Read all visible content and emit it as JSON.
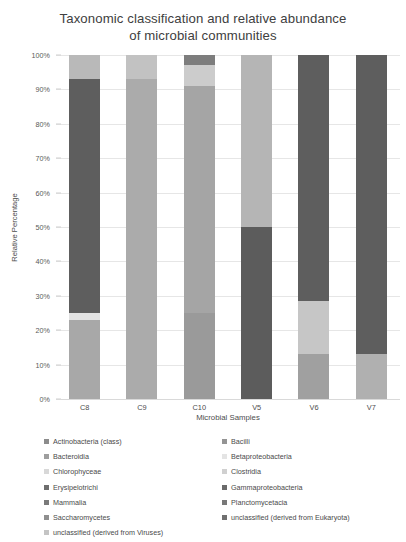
{
  "chart_data": {
    "type": "bar",
    "subtype": "stacked-bar-100-percent",
    "title": "Taxonomic classification and relative abundance of microbial communities",
    "title_lines": [
      "Taxonomic classification and relative abundance",
      "of microbial communities"
    ],
    "xlabel": "Microbial Samples",
    "ylabel": "Relative Percentage",
    "categories": [
      "C8",
      "C9",
      "C10",
      "V5",
      "V6",
      "V7"
    ],
    "ylim": [
      0,
      100
    ],
    "ytick_labels": [
      "0%",
      "10%",
      "20%",
      "30%",
      "40%",
      "50%",
      "60%",
      "70%",
      "80%",
      "90%",
      "100%"
    ],
    "ytick_values": [
      0,
      10,
      20,
      30,
      40,
      50,
      60,
      70,
      80,
      90,
      100
    ],
    "grid": true,
    "legend_position": "bottom",
    "legend_columns": 2,
    "series": [
      {
        "name": "Actinobacteria (class)",
        "color": "#8c8c8c",
        "values": [
          0,
          0,
          0,
          0,
          0,
          0
        ]
      },
      {
        "name": "Bacilli",
        "color": "#a6a6a6",
        "values": [
          23,
          7,
          25,
          0,
          13,
          13
        ]
      },
      {
        "name": "Bacteroidia",
        "color": "#bfbfbf",
        "values": [
          7,
          7,
          6,
          0,
          0,
          0
        ]
      },
      {
        "name": "Betaproteobacteria",
        "color": "#f2f2f2",
        "values": [
          0,
          0,
          0,
          0,
          0,
          0
        ]
      },
      {
        "name": "Chlorophyceae",
        "color": "#e8e8e8",
        "values": [
          0,
          0,
          0,
          0,
          0,
          0
        ]
      },
      {
        "name": "Clostridia",
        "color": "#d9d9d9",
        "values": [
          68,
          86,
          66,
          50,
          15.5,
          0
        ]
      },
      {
        "name": "Erysipelotrichi",
        "color": "#efefef",
        "values": [
          2,
          0,
          0,
          0,
          0,
          0
        ]
      },
      {
        "name": "Gammaproteobacteria",
        "color": "#595959",
        "values": [
          0,
          0,
          0,
          50,
          71.5,
          87
        ]
      },
      {
        "name": "Mammalia",
        "color": "#808080",
        "values": [
          0,
          0,
          0,
          0,
          0,
          0
        ]
      },
      {
        "name": "Planctomycetacia",
        "color": "#737373",
        "values": [
          0,
          0,
          0,
          0,
          0,
          0
        ]
      },
      {
        "name": "Saccharomycetes",
        "color": "#999999",
        "values": [
          0,
          0,
          0,
          0,
          0,
          0
        ]
      },
      {
        "name": "unclassified (derived from Eukaryota)",
        "color": "#6b6b6b",
        "values": [
          0,
          0,
          0,
          0,
          0,
          0
        ]
      },
      {
        "name": "unclassified (derived from Viruses)",
        "color": "#cfcfcf",
        "values": [
          0,
          0,
          0,
          0,
          0,
          0
        ]
      }
    ],
    "bars": [
      {
        "category": "C8",
        "segments": [
          {
            "name": "Bacteroidia",
            "value": 7,
            "color": "#b9b9b9"
          },
          {
            "name": "Clostridia",
            "value": 68,
            "color": "#5e5e5e"
          },
          {
            "name": "Erysipelotrichi",
            "value": 2,
            "color": "#e2e2e2"
          },
          {
            "name": "Bacilli",
            "value": 23,
            "color": "#a8a8a8"
          }
        ]
      },
      {
        "category": "C9",
        "segments": [
          {
            "name": "Bacteroidia",
            "value": 7,
            "color": "#c2c2c2"
          },
          {
            "name": "Clostridia",
            "value": 86,
            "color": "#ababab"
          },
          {
            "name": "Bacilli",
            "value": 7,
            "color": "#ababab"
          }
        ]
      },
      {
        "category": "C10",
        "segments": [
          {
            "name": "Actinobacteria (class)",
            "value": 3,
            "color": "#7d7d7d"
          },
          {
            "name": "Bacteroidia",
            "value": 6,
            "color": "#cccccc"
          },
          {
            "name": "Clostridia",
            "value": 66,
            "color": "#a5a5a5"
          },
          {
            "name": "Bacilli",
            "value": 25,
            "color": "#9a9a9a"
          }
        ]
      },
      {
        "category": "V5",
        "segments": [
          {
            "name": "Clostridia",
            "value": 50,
            "color": "#b5b5b5"
          },
          {
            "name": "Gammaproteobacteria",
            "value": 50,
            "color": "#5c5c5c"
          }
        ]
      },
      {
        "category": "V6",
        "segments": [
          {
            "name": "Gammaproteobacteria",
            "value": 71.5,
            "color": "#5e5e5e"
          },
          {
            "name": "Clostridia",
            "value": 15.5,
            "color": "#c6c6c6"
          },
          {
            "name": "Bacilli",
            "value": 13,
            "color": "#a0a0a0"
          }
        ]
      },
      {
        "category": "V7",
        "segments": [
          {
            "name": "Gammaproteobacteria",
            "value": 87,
            "color": "#5e5e5e"
          },
          {
            "name": "Bacilli",
            "value": 13,
            "color": "#b0b0b0"
          }
        ]
      }
    ]
  },
  "legend": {
    "column1": [
      {
        "label": "Actinobacteria (class)",
        "color": "#8c8c8c"
      },
      {
        "label": "Bacteroidia",
        "color": "#9e9e9e"
      },
      {
        "label": "Chlorophyceae",
        "color": "#d8d8d8"
      },
      {
        "label": "Erysipelotrichi",
        "color": "#6e6e6e"
      },
      {
        "label": "Mammalia",
        "color": "#7a7a7a"
      },
      {
        "label": "Saccharomycetes",
        "color": "#8f8f8f"
      },
      {
        "label": "unclassified (derived from Viruses)",
        "color": "#c4c4c4"
      }
    ],
    "column2": [
      {
        "label": "Bacilli",
        "color": "#949494"
      },
      {
        "label": "Betaproteobacteria",
        "color": "#e4e4e4"
      },
      {
        "label": "Clostridia",
        "color": "#d0d0d0"
      },
      {
        "label": "Gammaproteobacteria",
        "color": "#6b6b6b"
      },
      {
        "label": "Planctomycetacia",
        "color": "#787878"
      },
      {
        "label": "unclassified (derived from Eukaryota)",
        "color": "#707070"
      }
    ]
  }
}
